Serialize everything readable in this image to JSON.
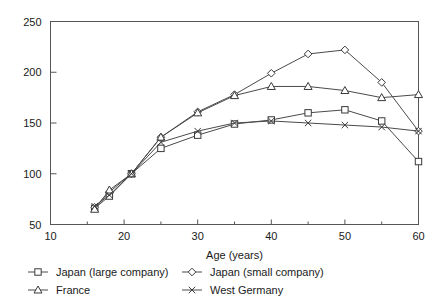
{
  "chart_data": {
    "type": "line",
    "title": "",
    "xlabel": "Age (years)",
    "ylabel": "",
    "xlim": [
      10,
      60
    ],
    "ylim": [
      50,
      250
    ],
    "xticks": [
      10,
      20,
      30,
      40,
      50,
      60
    ],
    "xtick_labels": [
      "10",
      "20",
      "30",
      "40",
      "50",
      "60"
    ],
    "xminor_ticks": [
      15,
      25,
      35,
      45,
      55
    ],
    "yticks": [
      50,
      100,
      150,
      200,
      250
    ],
    "ytick_labels": [
      "50",
      "100",
      "150",
      "200",
      "250"
    ],
    "grid": false,
    "legend_position": "below",
    "series": [
      {
        "name": "Japan (large company)",
        "marker": "square",
        "x": [
          16,
          18,
          21,
          25,
          30,
          35,
          40,
          45,
          50,
          55,
          60
        ],
        "values": [
          66,
          78,
          100,
          125,
          138,
          149,
          153,
          160,
          163,
          152,
          112
        ]
      },
      {
        "name": "Japan (small company)",
        "marker": "diamond",
        "x": [
          16,
          18,
          21,
          25,
          30,
          35,
          40,
          45,
          50,
          55,
          60
        ],
        "values": [
          67,
          82,
          100,
          136,
          161,
          178,
          199,
          218,
          222,
          190,
          142
        ]
      },
      {
        "name": "France",
        "marker": "triangle",
        "x": [
          16,
          18,
          21,
          25,
          30,
          35,
          40,
          45,
          50,
          55,
          60
        ],
        "values": [
          65,
          84,
          100,
          136,
          160,
          177,
          186,
          186,
          182,
          175,
          178
        ]
      },
      {
        "name": "West Germany",
        "marker": "x",
        "x": [
          16,
          18,
          21,
          25,
          30,
          35,
          40,
          45,
          50,
          55,
          60
        ],
        "values": [
          68,
          79,
          100,
          131,
          142,
          150,
          152,
          150,
          148,
          146,
          142
        ]
      }
    ]
  },
  "legend": {
    "entries": [
      {
        "label": "Japan (large company)"
      },
      {
        "label": "Japan (small company)"
      },
      {
        "label": "France"
      },
      {
        "label": "West Germany"
      }
    ]
  }
}
